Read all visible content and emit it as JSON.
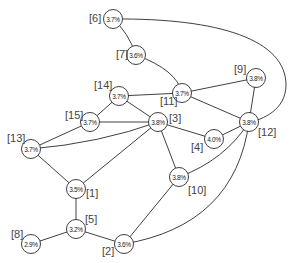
{
  "diagram": {
    "nodes": [
      {
        "id": "1",
        "label": "[1]",
        "value": "3.5%",
        "x": 76,
        "y": 189,
        "lx": 86,
        "ly": 193
      },
      {
        "id": "2",
        "label": "[2]",
        "value": "3.6%",
        "x": 124,
        "y": 244,
        "lx": 102,
        "ly": 251
      },
      {
        "id": "3",
        "label": "[3]",
        "value": "3.8%",
        "x": 158,
        "y": 122,
        "lx": 169,
        "ly": 118
      },
      {
        "id": "4",
        "label": "[4]",
        "value": "4.0%",
        "x": 214,
        "y": 139,
        "lx": 191,
        "ly": 147
      },
      {
        "id": "5",
        "label": "[5]",
        "value": "3.2%",
        "x": 76,
        "y": 229,
        "lx": 85,
        "ly": 219
      },
      {
        "id": "6",
        "label": "[6]",
        "value": "3.7%",
        "x": 113,
        "y": 19,
        "lx": 89,
        "ly": 18
      },
      {
        "id": "7",
        "label": "[7]",
        "value": "3.6%",
        "x": 136,
        "y": 55,
        "lx": 116,
        "ly": 54
      },
      {
        "id": "8",
        "label": "[8]",
        "value": "2.9%",
        "x": 31,
        "y": 244,
        "lx": 11,
        "ly": 234
      },
      {
        "id": "9",
        "label": "[9]",
        "value": "3.8%",
        "x": 256,
        "y": 78,
        "lx": 234,
        "ly": 69
      },
      {
        "id": "10",
        "label": "[10]",
        "value": "3.8%",
        "x": 179,
        "y": 177,
        "lx": 188,
        "ly": 190
      },
      {
        "id": "11",
        "label": "[11]",
        "value": "3.7%",
        "x": 182,
        "y": 93,
        "lx": 160,
        "ly": 101
      },
      {
        "id": "12",
        "label": "[12]",
        "value": "3.8%",
        "x": 249,
        "y": 122,
        "lx": 258,
        "ly": 132
      },
      {
        "id": "13",
        "label": "[13]",
        "value": "3.7%",
        "x": 31,
        "y": 149,
        "lx": 7,
        "ly": 138
      },
      {
        "id": "14",
        "label": "[14]",
        "value": "3.7%",
        "x": 119,
        "y": 96,
        "lx": 94,
        "ly": 85
      },
      {
        "id": "15",
        "label": "[15]",
        "value": "3.7%",
        "x": 90,
        "y": 122,
        "lx": 65,
        "ly": 115
      }
    ],
    "edges": [
      {
        "from": "6",
        "to": "7",
        "path": "M113,19 Q128,32 136,55"
      },
      {
        "from": "6",
        "to": "12",
        "path": "M113,19 C220,18 286,40 286,85 C286,110 262,120 249,122"
      },
      {
        "from": "7",
        "to": "11",
        "path": "M136,55 Q177,70 182,93"
      },
      {
        "from": "11",
        "to": "14",
        "path": "M182,93 L119,96"
      },
      {
        "from": "11",
        "to": "9",
        "path": "M182,93 L256,78"
      },
      {
        "from": "11",
        "to": "12",
        "path": "M182,93 L249,122"
      },
      {
        "from": "9",
        "to": "12",
        "path": "M256,78 L249,122"
      },
      {
        "from": "14",
        "to": "15",
        "path": "M119,96 L90,122"
      },
      {
        "from": "14",
        "to": "3",
        "path": "M119,96 L158,122"
      },
      {
        "from": "15",
        "to": "3",
        "path": "M90,122 L158,122"
      },
      {
        "from": "15",
        "to": "13",
        "path": "M90,122 L31,149"
      },
      {
        "from": "13",
        "to": "3",
        "path": "M31,149 Q100,143 158,122"
      },
      {
        "from": "13",
        "to": "1",
        "path": "M31,149 L76,189"
      },
      {
        "from": "1",
        "to": "3",
        "path": "M76,189 L158,122"
      },
      {
        "from": "3",
        "to": "4",
        "path": "M158,122 L214,139"
      },
      {
        "from": "3",
        "to": "10",
        "path": "M158,122 L179,177"
      },
      {
        "from": "4",
        "to": "12",
        "path": "M214,139 L249,122"
      },
      {
        "from": "10",
        "to": "12",
        "path": "M179,177 Q225,160 249,122"
      },
      {
        "from": "10",
        "to": "2",
        "path": "M179,177 L124,244"
      },
      {
        "from": "12",
        "to": "2",
        "path": "M249,122 Q235,225 124,244"
      },
      {
        "from": "1",
        "to": "5",
        "path": "M76,189 L76,229"
      },
      {
        "from": "5",
        "to": "8",
        "path": "M76,229 L31,244"
      },
      {
        "from": "5",
        "to": "2",
        "path": "M76,229 L124,244"
      }
    ],
    "style": {
      "line_color": "#2a2a2a",
      "node_fill": "#ffffff",
      "node_radius": 9.5
    }
  }
}
